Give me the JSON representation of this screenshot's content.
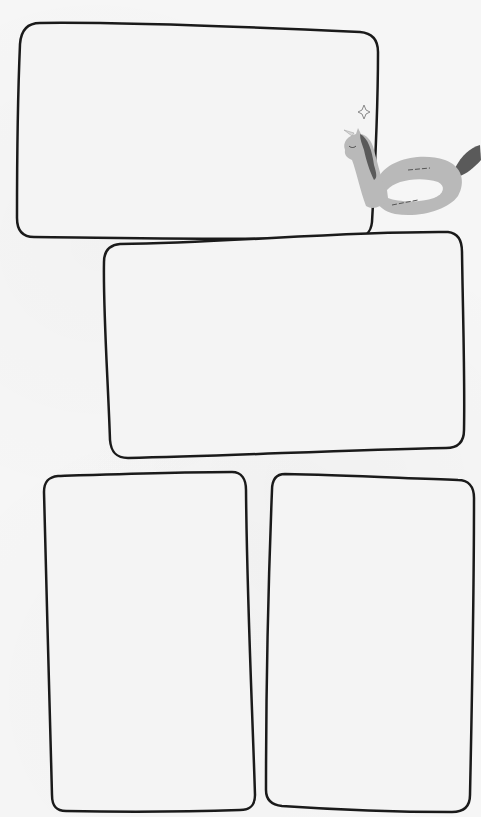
{
  "template": {
    "background_color": "#f6f6f6",
    "frame_stroke_color": "#1a1a1a",
    "frame_fill_color": "#f4f4f4",
    "frames": [
      {
        "id": "frame-1",
        "label": ""
      },
      {
        "id": "frame-2",
        "label": ""
      },
      {
        "id": "frame-3",
        "label": ""
      },
      {
        "id": "frame-4",
        "label": ""
      }
    ]
  },
  "decoration": {
    "illustration": "unicorn-pool-float-icon",
    "body_color": "#b9b9b9",
    "mane_color": "#5a5a5a",
    "sparkle": "sparkle-icon"
  }
}
